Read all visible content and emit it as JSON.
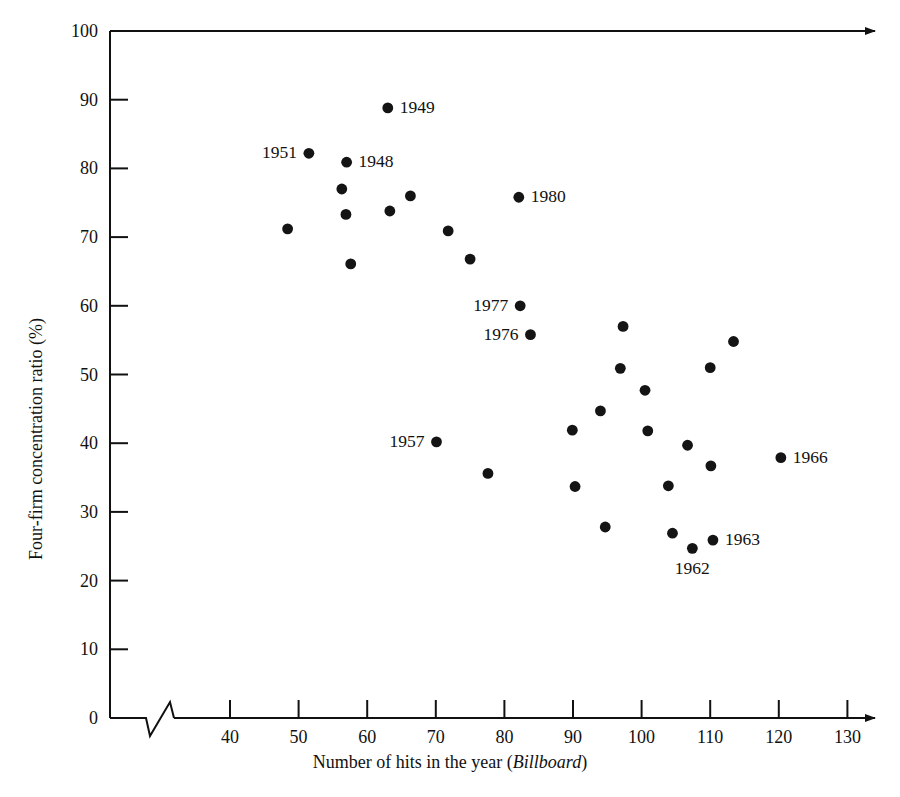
{
  "chart_data": {
    "type": "scatter",
    "title": "",
    "xlabel": "Number of hits in the year (Billboard)",
    "xlabel_plain": "Number of hits in the year",
    "xlabel_italic": "Billboard",
    "ylabel": "Four-firm concentration ratio (%)",
    "xlim": [
      33,
      132
    ],
    "ylim": [
      0,
      100
    ],
    "x_ticks": [
      40,
      50,
      60,
      70,
      80,
      90,
      100,
      110,
      120,
      130
    ],
    "y_ticks": [
      0,
      10,
      20,
      30,
      40,
      50,
      60,
      70,
      80,
      90,
      100
    ],
    "x_axis_break": true,
    "x_axis_arrow": true,
    "top_axis_arrow": true,
    "grid": false,
    "legend": null,
    "points": [
      {
        "x": 48.4,
        "y": 71.2,
        "label": null
      },
      {
        "x": 51.5,
        "y": 82.2,
        "label": "1951",
        "label_pos": "left"
      },
      {
        "x": 56.3,
        "y": 77.0,
        "label": null
      },
      {
        "x": 57.0,
        "y": 80.9,
        "label": "1948",
        "label_pos": "right"
      },
      {
        "x": 56.9,
        "y": 73.3,
        "label": null
      },
      {
        "x": 57.6,
        "y": 66.1,
        "label": null
      },
      {
        "x": 63.0,
        "y": 88.8,
        "label": "1949",
        "label_pos": "right"
      },
      {
        "x": 63.3,
        "y": 73.8,
        "label": null
      },
      {
        "x": 66.3,
        "y": 76.0,
        "label": null
      },
      {
        "x": 71.8,
        "y": 70.9,
        "label": null
      },
      {
        "x": 70.1,
        "y": 40.2,
        "label": "1957",
        "label_pos": "left"
      },
      {
        "x": 75.0,
        "y": 66.8,
        "label": null
      },
      {
        "x": 77.6,
        "y": 35.6,
        "label": null
      },
      {
        "x": 82.1,
        "y": 75.8,
        "label": "1980",
        "label_pos": "right"
      },
      {
        "x": 82.3,
        "y": 60.0,
        "label": "1977",
        "label_pos": "left"
      },
      {
        "x": 83.8,
        "y": 55.8,
        "label": "1976",
        "label_pos": "left"
      },
      {
        "x": 89.9,
        "y": 41.9,
        "label": null
      },
      {
        "x": 90.3,
        "y": 33.7,
        "label": null
      },
      {
        "x": 94.0,
        "y": 44.7,
        "label": null
      },
      {
        "x": 94.7,
        "y": 27.8,
        "label": null
      },
      {
        "x": 97.3,
        "y": 57.0,
        "label": null
      },
      {
        "x": 96.9,
        "y": 50.9,
        "label": null
      },
      {
        "x": 100.5,
        "y": 47.7,
        "label": null
      },
      {
        "x": 100.9,
        "y": 41.8,
        "label": null
      },
      {
        "x": 103.9,
        "y": 33.8,
        "label": null
      },
      {
        "x": 104.5,
        "y": 26.9,
        "label": null
      },
      {
        "x": 106.7,
        "y": 39.7,
        "label": null
      },
      {
        "x": 107.4,
        "y": 24.7,
        "label": "1962",
        "label_pos": "below"
      },
      {
        "x": 110.1,
        "y": 36.7,
        "label": null
      },
      {
        "x": 110.4,
        "y": 25.9,
        "label": "1963",
        "label_pos": "right"
      },
      {
        "x": 110.0,
        "y": 51.0,
        "label": null
      },
      {
        "x": 113.4,
        "y": 54.8,
        "label": null
      },
      {
        "x": 120.3,
        "y": 37.9,
        "label": "1966",
        "label_pos": "right"
      }
    ],
    "colors": {
      "marker": "#141414",
      "axis": "#111111",
      "background": "#ffffff",
      "text": "#111111"
    }
  }
}
